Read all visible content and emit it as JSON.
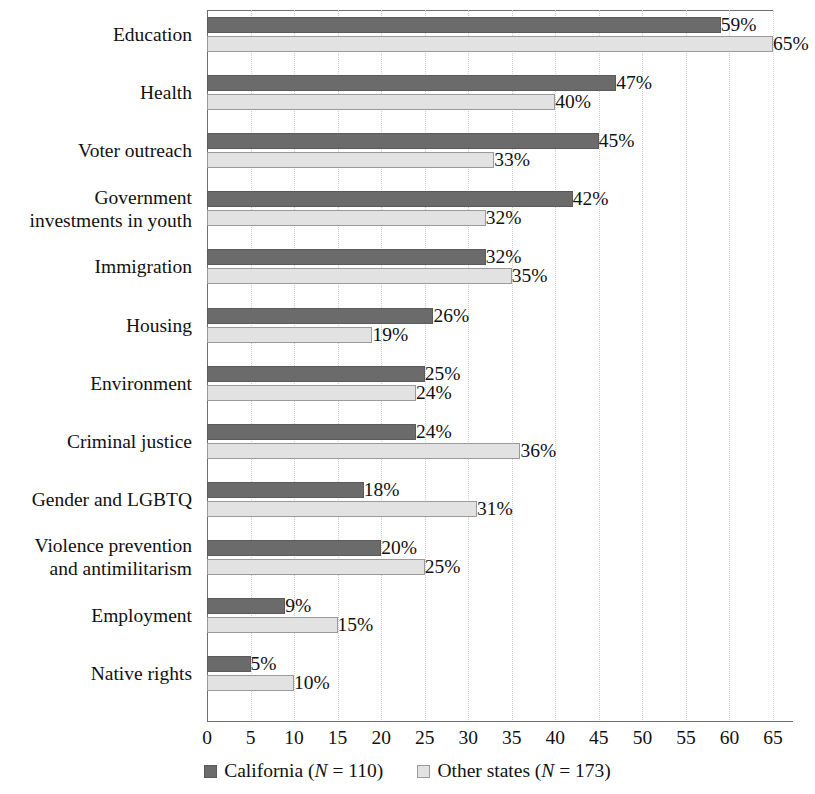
{
  "chart_data": {
    "type": "bar",
    "orientation": "horizontal",
    "title": "",
    "subtitle": "",
    "xlabel": "",
    "ylabel": "",
    "xlim": [
      0,
      65
    ],
    "xticks": [
      0,
      5,
      10,
      15,
      20,
      25,
      30,
      35,
      40,
      45,
      50,
      55,
      60,
      65
    ],
    "xtick_labels": [
      "0",
      "5",
      "10",
      "15",
      "20",
      "25",
      "30",
      "35",
      "40",
      "45",
      "50",
      "55",
      "60",
      "65"
    ],
    "grid": "vertical-dotted",
    "legend_position": "bottom-center",
    "value_label_suffix": "%",
    "categories": [
      "Education",
      "Health",
      "Voter outreach",
      "Government\ninvestments in youth",
      "Immigration",
      "Housing",
      "Environment",
      "Criminal justice",
      "Gender and LGBTQ",
      "Violence prevention\nand antimilitarism",
      "Employment",
      "Native rights"
    ],
    "series": [
      {
        "name": "California",
        "legend_label": "California (N = 110)",
        "n": 110,
        "color": "#6b6b6b",
        "values": [
          59,
          47,
          45,
          42,
          32,
          26,
          25,
          24,
          18,
          20,
          9,
          5
        ],
        "value_labels": [
          "59%",
          "47%",
          "45%",
          "42%",
          "32%",
          "26%",
          "25%",
          "24%",
          "18%",
          "20%",
          "9%",
          "5%"
        ]
      },
      {
        "name": "Other states",
        "legend_label": "Other states (N = 173)",
        "n": 173,
        "color": "#e2e2e2",
        "values": [
          65,
          40,
          33,
          32,
          35,
          19,
          24,
          36,
          31,
          25,
          15,
          10
        ],
        "value_labels": [
          "65%",
          "40%",
          "33%",
          "32%",
          "35%",
          "19%",
          "24%",
          "36%",
          "31%",
          "25%",
          "15%",
          "10%"
        ]
      }
    ]
  },
  "legend": {
    "items": [
      {
        "prefix": "California (",
        "italic": "N",
        "suffix": " = 110)"
      },
      {
        "prefix": "Other states (",
        "italic": "N",
        "suffix": " = 173)"
      }
    ]
  }
}
